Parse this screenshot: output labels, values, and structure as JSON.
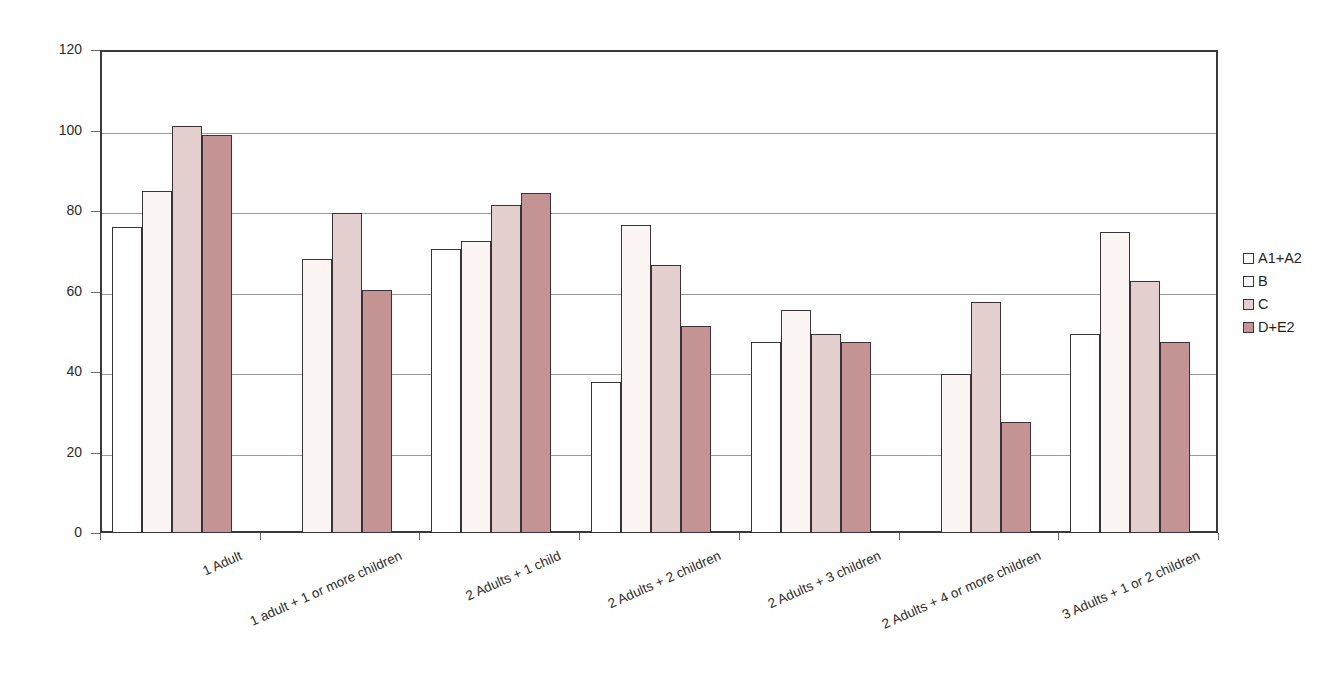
{
  "chart_data": {
    "type": "bar",
    "title": "",
    "subtitle": "",
    "xlabel": "",
    "ylabel": "",
    "ylim": [
      0,
      120
    ],
    "yticks": [
      0,
      20,
      40,
      60,
      80,
      100,
      120
    ],
    "ytick_labels": [
      "0",
      "20",
      "40",
      "60",
      "80",
      "100",
      "120"
    ],
    "grid": "horizontal",
    "legend_position": "right",
    "categories": [
      "1 Adult",
      "1 adult + 1 or more children",
      "2 Adults + 1 child",
      "2 Adults + 2 children",
      "2 Adults + 3 children",
      "2 Adults + 4 or more children",
      "3 Adults + 1 or 2 children"
    ],
    "series": [
      {
        "name": "A1+A2",
        "color": "#ffffff",
        "values": [
          76,
          null,
          70.5,
          37.5,
          47.5,
          null,
          49.5
        ]
      },
      {
        "name": "B",
        "color": "#fbf5f4",
        "values": [
          85,
          68,
          72.5,
          76.5,
          55.5,
          39.5,
          74.8
        ]
      },
      {
        "name": "C",
        "color": "#e3cfcd",
        "values": [
          101,
          79.5,
          81.5,
          66.5,
          49.5,
          57.5,
          62.5
        ]
      },
      {
        "name": "D+E2",
        "color": "#c49494",
        "values": [
          99,
          60.5,
          84.5,
          51.5,
          47.5,
          27.5,
          47.5
        ]
      }
    ]
  },
  "legend": {
    "items": [
      {
        "label": "A1+A2"
      },
      {
        "label": "B"
      },
      {
        "label": "C"
      },
      {
        "label": "D+E2"
      }
    ]
  },
  "colors": {
    "axis": "#3a3a3a",
    "gridline": "#9a9a9a",
    "bar_outline": "#3b3237",
    "series_a": "#ffffff",
    "series_b": "#fbf5f4",
    "series_c": "#e3cfcd",
    "series_d": "#c49494"
  }
}
